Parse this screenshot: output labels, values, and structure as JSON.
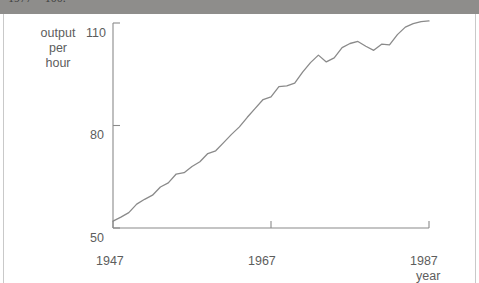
{
  "caption": {
    "clipped_line": "1977 = 100."
  },
  "chart_data": {
    "type": "line",
    "title": "",
    "xlabel": "year",
    "ylabel": "output per hour",
    "ylabel_lines": [
      "output",
      "per",
      "hour"
    ],
    "xlim": [
      1947,
      1987
    ],
    "ylim": [
      50,
      110
    ],
    "yticks": [
      50,
      80,
      110
    ],
    "ytick_labels": [
      "50",
      "80",
      "110"
    ],
    "xticks": [
      1947,
      1967,
      1987
    ],
    "xtick_labels": [
      "1947",
      "1967",
      "1987"
    ],
    "grid": false,
    "legend": false,
    "line_color": "#8a8a8a",
    "series": [
      {
        "name": "output per hour",
        "x": [
          1947,
          1948,
          1949,
          1950,
          1951,
          1952,
          1953,
          1954,
          1955,
          1956,
          1957,
          1958,
          1959,
          1960,
          1961,
          1962,
          1963,
          1964,
          1965,
          1966,
          1967,
          1968,
          1969,
          1970,
          1971,
          1972,
          1973,
          1974,
          1975,
          1976,
          1977,
          1978,
          1979,
          1980,
          1981,
          1982,
          1983,
          1984,
          1985,
          1986,
          1987
        ],
        "values": [
          52.0,
          53.2,
          54.5,
          57.0,
          58.4,
          59.6,
          62.0,
          63.2,
          65.8,
          66.2,
          68.0,
          69.4,
          71.8,
          72.6,
          75.0,
          77.4,
          79.6,
          82.4,
          85.0,
          87.6,
          88.4,
          91.4,
          91.6,
          92.4,
          95.6,
          98.4,
          100.6,
          98.6,
          99.8,
          102.8,
          104.0,
          104.6,
          103.2,
          102.0,
          103.8,
          103.6,
          106.6,
          108.8,
          109.8,
          110.4,
          110.6
        ]
      }
    ]
  }
}
